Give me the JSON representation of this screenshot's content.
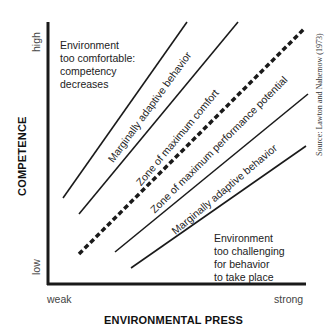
{
  "axes": {
    "y_title": "COMPETENCE",
    "y_high": "high",
    "y_low": "low",
    "x_title": "ENVIRONMENTAL PRESS",
    "x_weak": "weak",
    "x_strong": "strong"
  },
  "regions": {
    "top_left": [
      "Environment",
      "too comfortable:",
      "competency",
      "decreases"
    ],
    "bottom_right": [
      "Environment",
      "too challenging",
      "for behavior",
      "to take place"
    ]
  },
  "zones": [
    {
      "label": "Marginally adaptive behavior"
    },
    {
      "label": "Zone of maximum comfort"
    },
    {
      "label": "Zone of maximum performance potential"
    },
    {
      "label": "Marginally adaptive behavior"
    }
  ],
  "lines": [
    {
      "name": "upper-adaptive-boundary",
      "style": "solid",
      "x1": 63,
      "y1": 198,
      "x2": 187,
      "y2": 22
    },
    {
      "name": "comfort-boundary",
      "style": "solid",
      "x1": 79,
      "y1": 214,
      "x2": 238,
      "y2": 22
    },
    {
      "name": "adaptation-level",
      "style": "dashed",
      "x1": 79,
      "y1": 254,
      "x2": 305,
      "y2": 28
    },
    {
      "name": "performance-boundary",
      "style": "solid",
      "x1": 115,
      "y1": 252,
      "x2": 308,
      "y2": 94
    },
    {
      "name": "lower-adaptive-boundary",
      "style": "solid",
      "x1": 131,
      "y1": 268,
      "x2": 306,
      "y2": 146
    }
  ],
  "source": "Source: Lawton and Nahemow (1973)",
  "colors": {
    "ink": "#1a1a1a",
    "background": "#ffffff"
  }
}
